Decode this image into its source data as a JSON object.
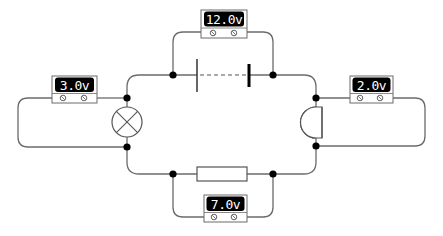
{
  "diagram": {
    "type": "series-circuit",
    "components": {
      "battery": {
        "label": "cell battery"
      },
      "lamp": {
        "label": "lamp"
      },
      "buzzer": {
        "label": "buzzer"
      },
      "resistor": {
        "label": "resistor"
      }
    },
    "voltmeters": {
      "battery": {
        "reading": "12.0v"
      },
      "lamp": {
        "reading": "3.0v"
      },
      "buzzer": {
        "reading": "2.0v"
      },
      "resistor": {
        "reading": "7.0v"
      }
    },
    "colors": {
      "wire": "#6b6b6b",
      "junction": "#000000",
      "display_bg": "#000000",
      "display_text": "#ffffff"
    }
  }
}
